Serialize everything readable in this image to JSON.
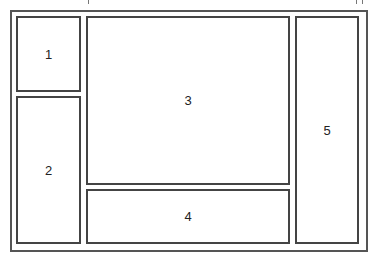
{
  "diagram": {
    "type": "layout-wireframe",
    "border_color": "#444444",
    "background": "#ffffff",
    "regions": [
      {
        "id": "1",
        "label": "1",
        "position": "top-left"
      },
      {
        "id": "2",
        "label": "2",
        "position": "bottom-left"
      },
      {
        "id": "3",
        "label": "3",
        "position": "center-main"
      },
      {
        "id": "4",
        "label": "4",
        "position": "bottom-center"
      },
      {
        "id": "5",
        "label": "5",
        "position": "right-column"
      }
    ]
  }
}
